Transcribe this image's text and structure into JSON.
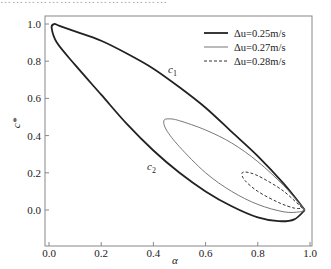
{
  "header_fragment": "……………………………………",
  "chart_data": {
    "type": "line",
    "title": "",
    "xlabel": "α",
    "ylabel": "c*",
    "xlim": [
      -0.01,
      1.02
    ],
    "ylim": [
      -0.19,
      1.04
    ],
    "xticks": [
      "0.0",
      "0.2",
      "0.4",
      "0.6",
      "0.8",
      "1.0"
    ],
    "yticks": [
      "0.0",
      "0.2",
      "0.4",
      "0.6",
      "0.8",
      "1.0"
    ],
    "grid": false,
    "legend_position": "upper right",
    "annotations": [
      {
        "text": "c1",
        "x": 0.46,
        "y": 0.82,
        "curve": "upper branch"
      },
      {
        "text": "c2",
        "x": 0.46,
        "y": 0.22,
        "curve": "lower branch"
      }
    ],
    "series": [
      {
        "name": "Δu=0.25m/s",
        "style": "solid-thick",
        "color": "#222222",
        "closed_loop": true,
        "points": [
          [
            0.98,
            0.0
          ],
          [
            0.9,
            0.14
          ],
          [
            0.8,
            0.29
          ],
          [
            0.7,
            0.42
          ],
          [
            0.6,
            0.55
          ],
          [
            0.5,
            0.66
          ],
          [
            0.4,
            0.76
          ],
          [
            0.3,
            0.84
          ],
          [
            0.2,
            0.91
          ],
          [
            0.1,
            0.96
          ],
          [
            0.04,
            0.99
          ],
          [
            0.02,
            1.0
          ],
          [
            0.01,
            0.98
          ],
          [
            0.03,
            0.9
          ],
          [
            0.1,
            0.78
          ],
          [
            0.2,
            0.62
          ],
          [
            0.3,
            0.46
          ],
          [
            0.4,
            0.32
          ],
          [
            0.5,
            0.2
          ],
          [
            0.6,
            0.1
          ],
          [
            0.7,
            0.02
          ],
          [
            0.8,
            -0.04
          ],
          [
            0.88,
            -0.06
          ],
          [
            0.94,
            -0.05
          ],
          [
            0.98,
            0.0
          ]
        ]
      },
      {
        "name": "Δu=0.27m/s",
        "style": "solid-thin",
        "color": "#777777",
        "closed_loop": true,
        "points": [
          [
            0.98,
            0.0
          ],
          [
            0.9,
            0.13
          ],
          [
            0.8,
            0.26
          ],
          [
            0.7,
            0.36
          ],
          [
            0.6,
            0.43
          ],
          [
            0.5,
            0.48
          ],
          [
            0.46,
            0.49
          ],
          [
            0.44,
            0.48
          ],
          [
            0.45,
            0.43
          ],
          [
            0.5,
            0.34
          ],
          [
            0.6,
            0.2
          ],
          [
            0.7,
            0.1
          ],
          [
            0.8,
            0.03
          ],
          [
            0.9,
            -0.01
          ],
          [
            0.96,
            -0.01
          ],
          [
            0.98,
            0.0
          ]
        ]
      },
      {
        "name": "Δu=0.28m/s",
        "style": "dashed",
        "color": "#333333",
        "closed_loop": true,
        "points": [
          [
            0.97,
            0.01
          ],
          [
            0.9,
            0.1
          ],
          [
            0.82,
            0.17
          ],
          [
            0.77,
            0.2
          ],
          [
            0.74,
            0.2
          ],
          [
            0.75,
            0.16
          ],
          [
            0.8,
            0.1
          ],
          [
            0.88,
            0.04
          ],
          [
            0.94,
            0.01
          ],
          [
            0.97,
            0.01
          ]
        ]
      }
    ]
  },
  "legend": {
    "items": [
      {
        "label": "Δu=0.25m/s",
        "style": "solid-thick"
      },
      {
        "label": "Δu=0.27m/s",
        "style": "solid-thin"
      },
      {
        "label": "Δu=0.28m/s",
        "style": "dashed"
      }
    ]
  },
  "annotations": {
    "c1": "c",
    "c1_sub": "1",
    "c2": "c",
    "c2_sub": "2"
  },
  "axes": {
    "x_label": "α",
    "y_label": "c*"
  }
}
